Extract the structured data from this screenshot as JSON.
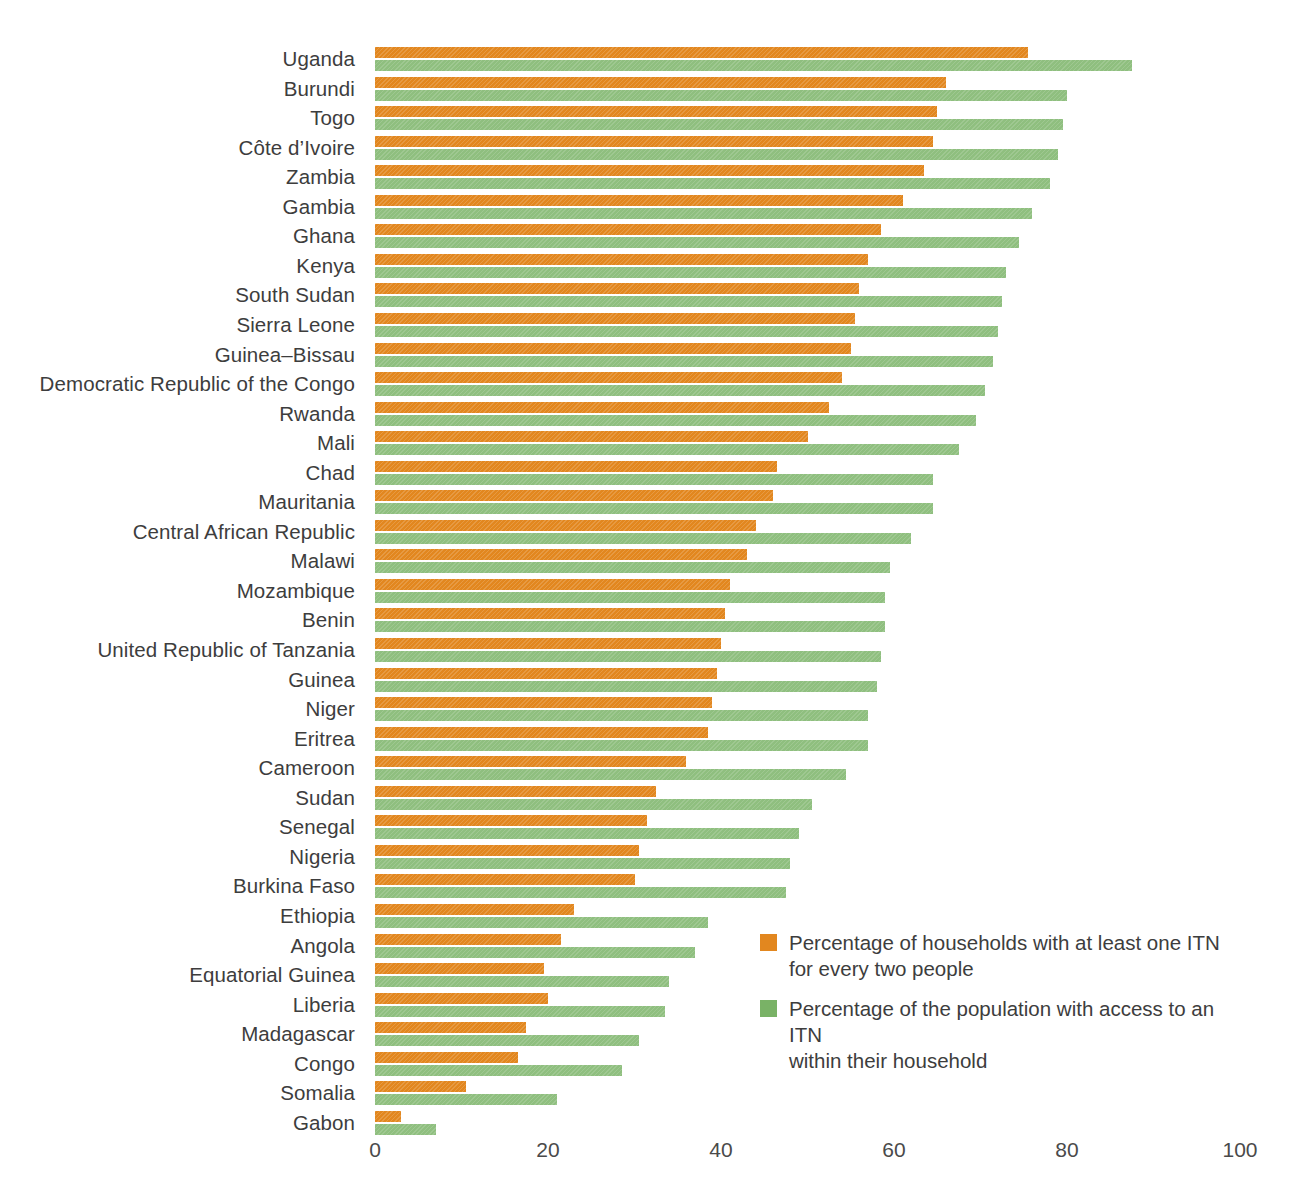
{
  "chart_data": {
    "type": "bar",
    "orientation": "horizontal",
    "grouped": true,
    "title": "",
    "subtitle": "",
    "xlabel": "",
    "ylabel": "",
    "xlim": [
      0,
      100
    ],
    "xticks": [
      "0",
      "20",
      "40",
      "60",
      "80",
      "100"
    ],
    "xtick_values": [
      0,
      20,
      40,
      60,
      80,
      100
    ],
    "grid": false,
    "legend_position": "middle-right-inside",
    "colors": {
      "households_itn": "#e2871f",
      "population_access": "#8fbf7f",
      "legend_green_swatch": "#79b266",
      "text": "#3d3d3d",
      "background": "#ffffff"
    },
    "series": [
      {
        "name": "Percentage of households with at least one ITN for every two people",
        "color": "#e2871f",
        "values": [
          75.5,
          66.0,
          65.0,
          64.5,
          63.5,
          61.0,
          58.5,
          57.0,
          56.0,
          55.5,
          55.0,
          54.0,
          52.5,
          50.0,
          46.5,
          46.0,
          44.0,
          43.0,
          41.0,
          40.5,
          40.0,
          39.5,
          39.0,
          38.5,
          36.0,
          32.5,
          31.5,
          30.5,
          30.0,
          23.0,
          21.5,
          19.5,
          20.0,
          17.5,
          16.5,
          10.5,
          3.0
        ]
      },
      {
        "name": "Percentage of the population with access to an ITN within their household",
        "color": "#8fbf7f",
        "values": [
          87.5,
          80.0,
          79.5,
          79.0,
          78.0,
          76.0,
          74.5,
          73.0,
          72.5,
          72.0,
          71.5,
          70.5,
          69.5,
          67.5,
          64.5,
          64.5,
          62.0,
          59.5,
          59.0,
          59.0,
          58.5,
          58.0,
          57.0,
          57.0,
          54.5,
          50.5,
          49.0,
          48.0,
          47.5,
          38.5,
          37.0,
          34.0,
          33.5,
          30.5,
          28.5,
          21.0,
          7.0
        ]
      }
    ],
    "categories": [
      "Uganda",
      "Burundi",
      "Togo",
      "Côte d’Ivoire",
      "Zambia",
      "Gambia",
      "Ghana",
      "Kenya",
      "South Sudan",
      "Sierra Leone",
      "Guinea–Bissau",
      "Democratic Republic of the Congo",
      "Rwanda",
      "Mali",
      "Chad",
      "Mauritania",
      "Central African Republic",
      "Malawi",
      "Mozambique",
      "Benin",
      "United Republic of Tanzania",
      "Guinea",
      "Niger",
      "Eritrea",
      "Cameroon",
      "Sudan",
      "Senegal",
      "Nigeria",
      "Burkina Faso",
      "Ethiopia",
      "Angola",
      "Equatorial Guinea",
      "Liberia",
      "Madagascar",
      "Congo",
      "Somalia",
      "Gabon"
    ]
  },
  "legend": {
    "items": [
      {
        "swatch": "orange",
        "line1": "Percentage of households with at least one ITN",
        "line2": "for every two people"
      },
      {
        "swatch": "green",
        "line1": "Percentage of the population with access to an ITN",
        "line2": "within their household"
      }
    ]
  }
}
